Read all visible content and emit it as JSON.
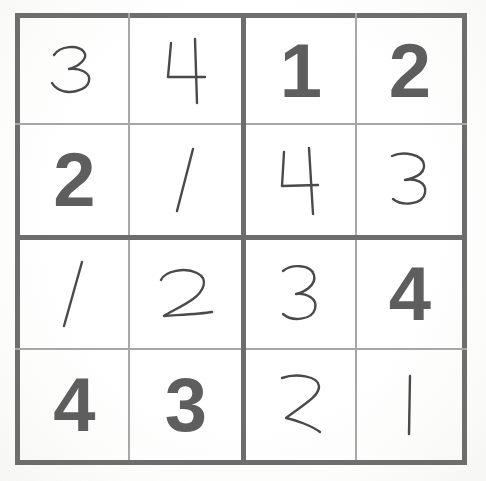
{
  "puzzle": {
    "title": "Sudoku 4x4",
    "size": 4,
    "box_rows": 2,
    "box_cols": 2,
    "colors": {
      "paper": "#fdfdfd",
      "thick_line": "#6d6d6d",
      "thin_line": "#a7a7a7",
      "printed_digit": "#5e5e5e",
      "handwritten_digit": "#4a4a4a"
    },
    "rows": [
      [
        {
          "value": "3",
          "style": "handwritten"
        },
        {
          "value": "4",
          "style": "handwritten"
        },
        {
          "value": "1",
          "style": "printed"
        },
        {
          "value": "2",
          "style": "printed"
        }
      ],
      [
        {
          "value": "2",
          "style": "printed"
        },
        {
          "value": "1",
          "style": "handwritten"
        },
        {
          "value": "4",
          "style": "handwritten"
        },
        {
          "value": "3",
          "style": "handwritten"
        }
      ],
      [
        {
          "value": "1",
          "style": "handwritten"
        },
        {
          "value": "2",
          "style": "handwritten"
        },
        {
          "value": "3",
          "style": "handwritten"
        },
        {
          "value": "4",
          "style": "printed"
        }
      ],
      [
        {
          "value": "4",
          "style": "printed"
        },
        {
          "value": "3",
          "style": "printed"
        },
        {
          "value": "2",
          "style": "handwritten"
        },
        {
          "value": "1",
          "style": "handwritten"
        }
      ]
    ]
  }
}
